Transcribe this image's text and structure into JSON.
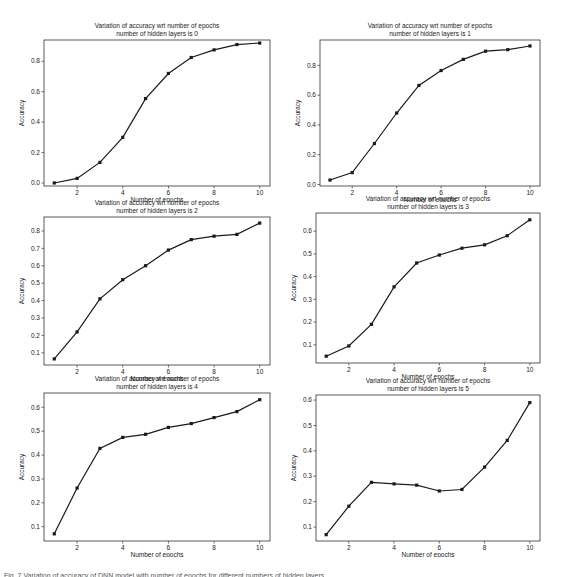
{
  "figure": {
    "caption": "Fig. 7 Variation of accuracy of DNN model with number of epochs for different numbers of hidden layers"
  },
  "chart_data": [
    {
      "type": "line",
      "title": "Variation of accuracy wrt number of epochs",
      "subtitle": "number of hidden layers is 0",
      "xlabel": "Number of epochs",
      "ylabel": "Accuracy",
      "x": [
        1,
        2,
        3,
        4,
        5,
        6,
        7,
        8,
        9,
        10
      ],
      "values": [
        0.0,
        0.03,
        0.135,
        0.3,
        0.555,
        0.72,
        0.825,
        0.875,
        0.91,
        0.92
      ],
      "xticks": [
        2,
        4,
        6,
        8,
        10
      ],
      "yticks": [
        0.0,
        0.2,
        0.4,
        0.6,
        0.8
      ],
      "ylim": [
        -0.02,
        0.94
      ],
      "grid": false,
      "marker": "square"
    },
    {
      "type": "line",
      "title": "Variation of accuracy wrt number of epochs",
      "subtitle": "number of hidden layers is 1",
      "xlabel": "Number of epochs",
      "ylabel": "Accuracy",
      "x": [
        1,
        2,
        3,
        4,
        5,
        6,
        7,
        8,
        9,
        10
      ],
      "values": [
        0.03,
        0.08,
        0.275,
        0.48,
        0.665,
        0.765,
        0.84,
        0.895,
        0.905,
        0.93
      ],
      "xticks": [
        2,
        4,
        6,
        8,
        10
      ],
      "yticks": [
        0.0,
        0.2,
        0.4,
        0.6,
        0.8
      ],
      "ylim": [
        -0.01,
        0.97
      ],
      "grid": false,
      "marker": "square"
    },
    {
      "type": "line",
      "title": "Variation of accuracy wrt number of epochs",
      "subtitle": "number of hidden layers is 2",
      "xlabel": "Number of epochs",
      "ylabel": "Accuracy",
      "x": [
        1,
        2,
        3,
        4,
        5,
        6,
        7,
        8,
        9,
        10
      ],
      "values": [
        0.065,
        0.22,
        0.41,
        0.52,
        0.6,
        0.69,
        0.75,
        0.77,
        0.78,
        0.845
      ],
      "xticks": [
        2,
        4,
        6,
        8,
        10
      ],
      "yticks": [
        0.1,
        0.2,
        0.3,
        0.4,
        0.5,
        0.6,
        0.7,
        0.8
      ],
      "ylim": [
        0.03,
        0.88
      ],
      "grid": false,
      "marker": "square"
    },
    {
      "type": "line",
      "title": "Variation of accuracy wrt number of epochs",
      "subtitle": "number of hidden layers is 3",
      "xlabel": "Number of epochs",
      "ylabel": "Accuracy",
      "x": [
        1,
        2,
        3,
        4,
        5,
        6,
        7,
        8,
        9,
        10
      ],
      "values": [
        0.05,
        0.095,
        0.19,
        0.355,
        0.46,
        0.495,
        0.525,
        0.54,
        0.58,
        0.65
      ],
      "xticks": [
        2,
        4,
        6,
        8,
        10
      ],
      "yticks": [
        0.1,
        0.2,
        0.3,
        0.4,
        0.5,
        0.6
      ],
      "ylim": [
        0.02,
        0.68
      ],
      "grid": false,
      "marker": "square"
    },
    {
      "type": "line",
      "title": "Variation of accuracy wrt number of epochs",
      "subtitle": "number of hidden layers is 4",
      "xlabel": "Number of epochs",
      "ylabel": "Accuracy",
      "x": [
        1,
        2,
        3,
        4,
        5,
        6,
        7,
        8,
        9,
        10
      ],
      "values": [
        0.07,
        0.262,
        0.428,
        0.474,
        0.487,
        0.516,
        0.532,
        0.557,
        0.582,
        0.632
      ],
      "xticks": [
        2,
        4,
        6,
        8,
        10
      ],
      "yticks": [
        0.1,
        0.2,
        0.3,
        0.4,
        0.5,
        0.6
      ],
      "ylim": [
        0.04,
        0.66
      ],
      "grid": false,
      "marker": "square"
    },
    {
      "type": "line",
      "title": "Variation of accuracy wrt number of epochs",
      "subtitle": "number of hidden layers is 5",
      "xlabel": "Number of epochs",
      "ylabel": "Accuracy",
      "x": [
        1,
        2,
        3,
        4,
        5,
        6,
        7,
        8,
        9,
        10
      ],
      "values": [
        0.07,
        0.182,
        0.276,
        0.27,
        0.265,
        0.242,
        0.248,
        0.336,
        0.441,
        0.59
      ],
      "xticks": [
        2,
        4,
        6,
        8,
        10
      ],
      "yticks": [
        0.1,
        0.2,
        0.3,
        0.4,
        0.5,
        0.6
      ],
      "ylim": [
        0.045,
        0.62
      ],
      "grid": false,
      "marker": "square"
    }
  ],
  "layout": {
    "panels": [
      {
        "left": 44,
        "top": 40,
        "width": 226,
        "height": 146
      },
      {
        "left": 320,
        "top": 40,
        "width": 220,
        "height": 146
      },
      {
        "left": 44,
        "top": 217,
        "width": 226,
        "height": 148
      },
      {
        "left": 316,
        "top": 213,
        "width": 224,
        "height": 150
      },
      {
        "left": 44,
        "top": 393,
        "width": 226,
        "height": 148
      },
      {
        "left": 316,
        "top": 395,
        "width": 224,
        "height": 146
      }
    ],
    "line_color": "#1a1a1a"
  }
}
